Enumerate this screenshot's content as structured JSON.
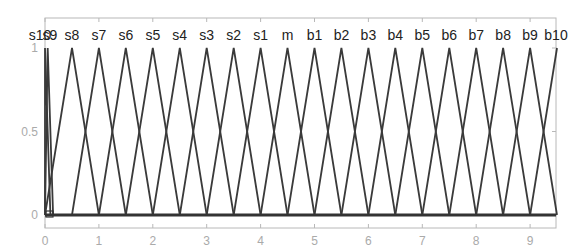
{
  "chart_data": {
    "type": "line",
    "title": "",
    "xlabel": "",
    "ylabel": "",
    "xlim": [
      0,
      9.5
    ],
    "ylim": [
      0,
      1
    ],
    "grid": false,
    "legend": "none",
    "x_ticks": [
      "0",
      "1",
      "2",
      "3",
      "4",
      "5",
      "6",
      "7",
      "8",
      "9"
    ],
    "y_ticks": [
      "0",
      "0.5",
      "1"
    ],
    "series": [
      {
        "name": "s10",
        "peak": 0.0,
        "x": [
          0.0,
          0.0,
          0.1
        ],
        "values": [
          0,
          1,
          0
        ]
      },
      {
        "name": "s9",
        "peak": 0.05,
        "x": [
          0.0,
          0.05,
          0.15
        ],
        "values": [
          0,
          1,
          0
        ]
      },
      {
        "name": "s8",
        "peak": 0.5,
        "x": [
          0.0,
          0.5,
          1.0
        ],
        "values": [
          0,
          1,
          0
        ]
      },
      {
        "name": "s7",
        "peak": 1.0,
        "x": [
          0.5,
          1.0,
          1.5
        ],
        "values": [
          0,
          1,
          0
        ]
      },
      {
        "name": "s6",
        "peak": 1.5,
        "x": [
          1.0,
          1.5,
          2.0
        ],
        "values": [
          0,
          1,
          0
        ]
      },
      {
        "name": "s5",
        "peak": 2.0,
        "x": [
          1.5,
          2.0,
          2.5
        ],
        "values": [
          0,
          1,
          0
        ]
      },
      {
        "name": "s4",
        "peak": 2.5,
        "x": [
          2.0,
          2.5,
          3.0
        ],
        "values": [
          0,
          1,
          0
        ]
      },
      {
        "name": "s3",
        "peak": 3.0,
        "x": [
          2.5,
          3.0,
          3.5
        ],
        "values": [
          0,
          1,
          0
        ]
      },
      {
        "name": "s2",
        "peak": 3.5,
        "x": [
          3.0,
          3.5,
          4.0
        ],
        "values": [
          0,
          1,
          0
        ]
      },
      {
        "name": "s1",
        "peak": 4.0,
        "x": [
          3.5,
          4.0,
          4.5
        ],
        "values": [
          0,
          1,
          0
        ]
      },
      {
        "name": "m",
        "peak": 4.5,
        "x": [
          4.0,
          4.5,
          5.0
        ],
        "values": [
          0,
          1,
          0
        ]
      },
      {
        "name": "b1",
        "peak": 5.0,
        "x": [
          4.5,
          5.0,
          5.5
        ],
        "values": [
          0,
          1,
          0
        ]
      },
      {
        "name": "b2",
        "peak": 5.5,
        "x": [
          5.0,
          5.5,
          6.0
        ],
        "values": [
          0,
          1,
          0
        ]
      },
      {
        "name": "b3",
        "peak": 6.0,
        "x": [
          5.5,
          6.0,
          6.5
        ],
        "values": [
          0,
          1,
          0
        ]
      },
      {
        "name": "b4",
        "peak": 6.5,
        "x": [
          6.0,
          6.5,
          7.0
        ],
        "values": [
          0,
          1,
          0
        ]
      },
      {
        "name": "b5",
        "peak": 7.0,
        "x": [
          6.5,
          7.0,
          7.5
        ],
        "values": [
          0,
          1,
          0
        ]
      },
      {
        "name": "b6",
        "peak": 7.5,
        "x": [
          7.0,
          7.5,
          8.0
        ],
        "values": [
          0,
          1,
          0
        ]
      },
      {
        "name": "b7",
        "peak": 8.0,
        "x": [
          7.5,
          8.0,
          8.5
        ],
        "values": [
          0,
          1,
          0
        ]
      },
      {
        "name": "b8",
        "peak": 8.5,
        "x": [
          8.0,
          8.5,
          9.0
        ],
        "values": [
          0,
          1,
          0
        ]
      },
      {
        "name": "b9",
        "peak": 9.0,
        "x": [
          8.5,
          9.0,
          9.5
        ],
        "values": [
          0,
          1,
          0
        ]
      },
      {
        "name": "b10",
        "peak": 9.5,
        "x": [
          9.0,
          9.5,
          9.5
        ],
        "values": [
          0,
          1,
          1
        ]
      }
    ],
    "top_labels": [
      "s10",
      "s9",
      "s8",
      "s7",
      "s6",
      "s5",
      "s4",
      "s3",
      "s2",
      "s1",
      "m",
      "b1",
      "b2",
      "b3",
      "b4",
      "b5",
      "b6",
      "b7",
      "b8",
      "b9",
      "b10"
    ]
  },
  "colors": {
    "line": "#3a3a3a",
    "frame": "#b8b8b8",
    "tick_text": "#aaaaaa",
    "label_text": "#222222"
  }
}
